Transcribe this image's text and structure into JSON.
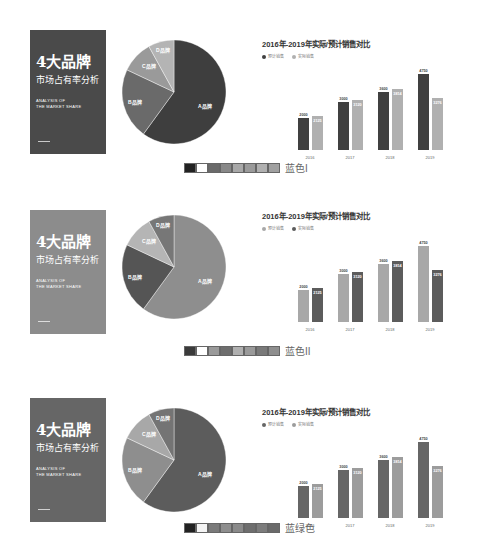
{
  "cover": {
    "title": "4大品牌",
    "subtitle": "市场占有率分析",
    "english_line1": "ANALYSIS OF",
    "english_line2": "THE MARKET SHARE"
  },
  "chart_title": "2016年-2019年实际/预计销售对比",
  "legend": {
    "expected": "预计销售",
    "actual": "实际销售"
  },
  "pie_labels": {
    "a": "A品牌",
    "b": "B品牌",
    "c": "C品牌",
    "d": "D品牌"
  },
  "themes": [
    {
      "name": "蓝色I",
      "cover_color": "#4a4a4a",
      "pie_colors": [
        "#3e3e3e",
        "#6a6a6a",
        "#9a9a9a",
        "#b4b4b4"
      ],
      "bar_expected": "#404040",
      "bar_actual": "#b0b0b0",
      "swatches": [
        "#222222",
        "#ffffff",
        "#6a6a6a",
        "#888888",
        "#a8a8a8",
        "#9a9a9a",
        "#b0b0b0",
        "#a0a0a0"
      ]
    },
    {
      "name": "蓝色II",
      "cover_color": "#8c8c8c",
      "pie_colors": [
        "#8e8e8e",
        "#555555",
        "#b5b5b5",
        "#777777"
      ],
      "bar_expected": "#a8a8a8",
      "bar_actual": "#5c5c5c",
      "swatches": [
        "#3a3a3a",
        "#ffffff",
        "#9a9a9a",
        "#6e6e6e",
        "#b0b0b0",
        "#9a9a9a",
        "#7a7a7a",
        "#8e8e8e"
      ]
    },
    {
      "name": "蓝绿色",
      "cover_color": "#666666",
      "pie_colors": [
        "#5c5c5c",
        "#8e8e8e",
        "#a8a8a8",
        "#747474"
      ],
      "bar_expected": "#666666",
      "bar_actual": "#9c9c9c",
      "swatches": [
        "#222222",
        "#f4f4f4",
        "#7a7a7a",
        "#8e8e8e",
        "#8a8a8a",
        "#6e6e6e",
        "#7c7c7c",
        "#6a6a6a"
      ]
    }
  ],
  "chart_data": [
    {
      "type": "pie",
      "title": "4大品牌市场占有率分析",
      "categories": [
        "A品牌",
        "B品牌",
        "C品牌",
        "D品牌"
      ],
      "values": [
        60,
        22,
        10,
        8
      ]
    },
    {
      "type": "bar",
      "title": "2016年-2019年实际/预计销售对比",
      "categories": [
        "2016",
        "2017",
        "2018",
        "2019"
      ],
      "series": [
        {
          "name": "预计销售",
          "values": [
            2000,
            3000,
            3600,
            4750
          ]
        },
        {
          "name": "实际销售",
          "values": [
            2125,
            3120,
            3814,
            3276
          ]
        }
      ],
      "xlabel": "",
      "ylabel": "",
      "ylim": [
        0,
        5000
      ],
      "legend_position": "top-left",
      "grid": false
    }
  ]
}
